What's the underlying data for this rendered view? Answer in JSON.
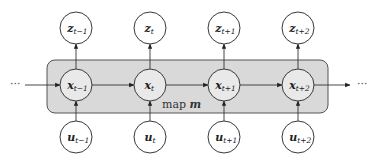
{
  "diagram": {
    "type": "state-space graphical model",
    "box_label": {
      "text": "map ",
      "var": "m"
    },
    "ellipsis": "···",
    "colors": {
      "box_fill": "#d9d9d9",
      "state_node_fill": "#e9e9e9",
      "node_fill": "#ffffff",
      "stroke": "#3a3a3a"
    },
    "columns": [
      {
        "z": {
          "base": "z",
          "sub": "t−1"
        },
        "x": {
          "base": "x",
          "sub": "t−1"
        },
        "u": {
          "base": "u",
          "sub": "t−1"
        }
      },
      {
        "z": {
          "base": "z",
          "sub": "t"
        },
        "x": {
          "base": "x",
          "sub": "t"
        },
        "u": {
          "base": "u",
          "sub": "t"
        }
      },
      {
        "z": {
          "base": "z",
          "sub": "t+1"
        },
        "x": {
          "base": "x",
          "sub": "t+1"
        },
        "u": {
          "base": "u",
          "sub": "t+1"
        }
      },
      {
        "z": {
          "base": "z",
          "sub": "t+2"
        },
        "x": {
          "base": "x",
          "sub": "t+2"
        },
        "u": {
          "base": "u",
          "sub": "t+2"
        }
      }
    ],
    "edges": [
      "u→x (each step)",
      "x→z (each step)",
      "x_t→x_{t+1} (chain)"
    ]
  }
}
